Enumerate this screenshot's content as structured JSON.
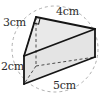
{
  "figure": {
    "shape_name": "triangular-prism",
    "cross_section": "right-triangle",
    "has_right_angle_marker": true,
    "background_guide": "dashed-circle",
    "colors": {
      "outline": "#1a1a1a",
      "hidden_edge": "#555555",
      "face_fill_light": "#f2f2f2",
      "face_fill_mid": "#e8e8e8",
      "face_fill_dark": "#dedede",
      "guide_circle": "#9a9a9a",
      "label_text": "#2b2b2b",
      "page_background": "#ffffff"
    },
    "labels": {
      "height_vertical": "3cm",
      "depth_vertical": "2cm",
      "top_edge": "4cm",
      "bottom_edge": "5cm"
    },
    "measurements": [
      {
        "name": "height-vertical",
        "value": 3,
        "unit": "cm",
        "text": "3cm"
      },
      {
        "name": "depth-vertical",
        "value": 2,
        "unit": "cm",
        "text": "2cm"
      },
      {
        "name": "top-edge",
        "value": 4,
        "unit": "cm",
        "text": "4cm"
      },
      {
        "name": "bottom-edge",
        "value": 5,
        "unit": "cm",
        "text": "5cm"
      }
    ]
  }
}
